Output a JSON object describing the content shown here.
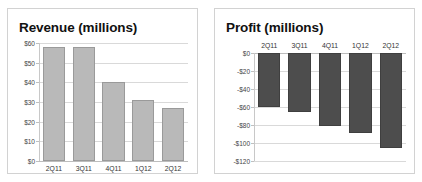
{
  "chart_data": [
    {
      "id": "revenue",
      "type": "bar",
      "title": "Revenue (millions)",
      "xlabel": "",
      "ylabel": "",
      "categories": [
        "2Q11",
        "3Q11",
        "4Q11",
        "1Q12",
        "2Q12"
      ],
      "values": [
        58,
        58,
        40,
        31,
        27
      ],
      "ylim": [
        0,
        60
      ],
      "ytick_values": [
        60,
        50,
        40,
        30,
        20,
        10,
        0
      ],
      "ytick_labels": [
        "$60",
        "$50",
        "$40",
        "$30",
        "$20",
        "$10",
        "$0"
      ],
      "grid": true,
      "legend": "none",
      "bar_color": "#b9b9b9",
      "bar_edge_color": "#9a9a9a",
      "category_label_position": "bottom"
    },
    {
      "id": "profit",
      "type": "bar",
      "title": "Profit (millions)",
      "xlabel": "",
      "ylabel": "",
      "categories": [
        "2Q11",
        "3Q11",
        "4Q11",
        "1Q12",
        "2Q12"
      ],
      "values": [
        -60,
        -65,
        -81,
        -89,
        -105
      ],
      "ylim": [
        -120,
        0
      ],
      "ytick_values": [
        0,
        -20,
        -40,
        -60,
        -80,
        -100,
        -120
      ],
      "ytick_labels": [
        "$0",
        "-$20",
        "-$40",
        "-$60",
        "-$80",
        "-$100",
        "-$120"
      ],
      "grid": true,
      "legend": "none",
      "bar_color": "#4d4d4d",
      "bar_edge_color": "#3f3f3f",
      "category_label_position": "top"
    }
  ],
  "colors": {
    "background": "#ffffff",
    "panel_border": "#d2d2d2",
    "gridline": "#d9d9d9",
    "axis": "#bdbdbd",
    "title_text": "#111111",
    "tick_text": "#444444"
  }
}
